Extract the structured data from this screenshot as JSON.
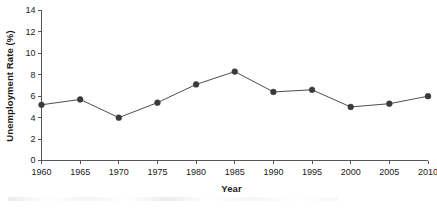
{
  "chart_data": {
    "type": "line",
    "title": "",
    "xlabel": "Year",
    "ylabel": "Unemployment Rate (%)",
    "x": [
      1960,
      1965,
      1970,
      1975,
      1980,
      1985,
      1990,
      1995,
      2000,
      2005,
      2010
    ],
    "values": [
      5.2,
      5.7,
      4.0,
      5.4,
      7.1,
      8.3,
      6.4,
      6.6,
      5.0,
      5.3,
      6.0
    ],
    "series": [
      {
        "name": "Unemployment Rate",
        "values": [
          5.2,
          5.7,
          4.0,
          5.4,
          7.1,
          8.3,
          6.4,
          6.6,
          5.0,
          5.3,
          6.0
        ]
      }
    ],
    "xtick_labels": [
      "1960",
      "1965",
      "1970",
      "1975",
      "1980",
      "1985",
      "1990",
      "1995",
      "2000",
      "2005",
      "2010"
    ],
    "ytick_labels": [
      "0",
      "2",
      "4",
      "6",
      "8",
      "10",
      "12",
      "14"
    ],
    "ytick_values": [
      0,
      2,
      4,
      6,
      8,
      10,
      12,
      14
    ],
    "xlim": [
      1960,
      2010
    ],
    "ylim": [
      0,
      14
    ],
    "grid": false,
    "legend": false,
    "legend_position": "none",
    "marker": "circle",
    "line_color": "#4d4d4d",
    "marker_color": "#3a3a3a",
    "axis_color": "#555555",
    "text_color": "#1a1a1a",
    "background_color": "#ffffff"
  }
}
